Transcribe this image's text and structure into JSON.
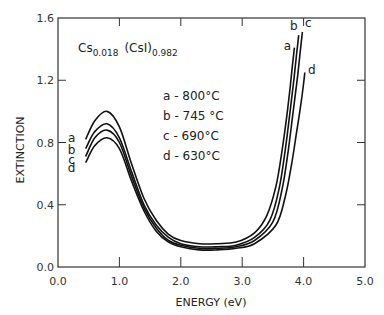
{
  "chart_data": {
    "type": "line",
    "title": "",
    "xlabel": "ENERGY (eV)",
    "ylabel": "EXTINCTION",
    "xlim": [
      0.0,
      5.0
    ],
    "ylim": [
      0.0,
      1.6
    ],
    "x_ticks": [
      0.0,
      1.0,
      2.0,
      3.0,
      4.0,
      5.0
    ],
    "x_tick_labels": [
      "0.0",
      "1.0",
      "2.0",
      "3.0",
      "4.0",
      "5.0"
    ],
    "y_ticks": [
      0.0,
      0.4,
      0.8,
      1.2,
      1.6
    ],
    "y_tick_labels": [
      "0.0",
      "0.4",
      "0.8",
      "1.2",
      "1.6"
    ],
    "grid": false,
    "annotation": {
      "formula_main1": "Cs",
      "formula_sub1": "0.018",
      "formula_main2": "(CsI)",
      "formula_sub2": "0.982"
    },
    "legend_entries": [
      "a - 800°C",
      "b - 745 °C",
      "c - 690°C",
      "d - 630°C"
    ],
    "series": [
      {
        "name": "a",
        "label": "a - 800°C",
        "x": [
          0.45,
          0.6,
          0.8,
          1.0,
          1.2,
          1.4,
          1.6,
          1.8,
          2.0,
          2.3,
          2.6,
          2.9,
          3.2,
          3.4,
          3.55,
          3.65,
          3.72,
          3.78,
          3.82,
          3.85
        ],
        "y": [
          0.82,
          0.94,
          1.0,
          0.9,
          0.66,
          0.44,
          0.3,
          0.21,
          0.17,
          0.15,
          0.15,
          0.16,
          0.22,
          0.33,
          0.52,
          0.75,
          0.95,
          1.15,
          1.3,
          1.41
        ]
      },
      {
        "name": "b",
        "label": "b - 745 °C",
        "x": [
          0.45,
          0.6,
          0.8,
          1.0,
          1.2,
          1.4,
          1.6,
          1.8,
          2.0,
          2.3,
          2.6,
          2.9,
          3.2,
          3.45,
          3.6,
          3.7,
          3.78,
          3.84,
          3.89,
          3.92
        ],
        "y": [
          0.76,
          0.87,
          0.92,
          0.83,
          0.61,
          0.4,
          0.27,
          0.19,
          0.15,
          0.13,
          0.13,
          0.14,
          0.19,
          0.3,
          0.5,
          0.75,
          1.0,
          1.2,
          1.38,
          1.49
        ]
      },
      {
        "name": "c",
        "label": "c - 690°C",
        "x": [
          0.45,
          0.6,
          0.8,
          1.0,
          1.2,
          1.4,
          1.6,
          1.8,
          2.0,
          2.3,
          2.6,
          2.9,
          3.2,
          3.5,
          3.65,
          3.75,
          3.83,
          3.9,
          3.95,
          3.98
        ],
        "y": [
          0.71,
          0.83,
          0.88,
          0.8,
          0.58,
          0.38,
          0.25,
          0.17,
          0.14,
          0.12,
          0.12,
          0.13,
          0.17,
          0.29,
          0.5,
          0.75,
          1.0,
          1.22,
          1.4,
          1.51
        ]
      },
      {
        "name": "d",
        "label": "d - 630°C",
        "x": [
          0.45,
          0.6,
          0.8,
          1.0,
          1.2,
          1.4,
          1.6,
          1.8,
          2.0,
          2.3,
          2.6,
          2.9,
          3.2,
          3.55,
          3.7,
          3.8,
          3.88,
          3.95,
          4.0,
          4.02
        ],
        "y": [
          0.67,
          0.78,
          0.83,
          0.76,
          0.55,
          0.36,
          0.23,
          0.16,
          0.13,
          0.11,
          0.11,
          0.12,
          0.15,
          0.27,
          0.45,
          0.65,
          0.85,
          1.03,
          1.18,
          1.25
        ]
      }
    ],
    "left_curve_labels": [
      "a",
      "b",
      "c",
      "d"
    ],
    "right_curve_labels": [
      "a",
      "b",
      "c",
      "d"
    ]
  }
}
